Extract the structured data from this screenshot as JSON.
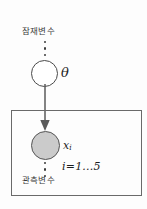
{
  "diagram": {
    "type": "plate-notation-graphical-model",
    "background_color": "#fdfdfd",
    "latent": {
      "label": "잠재변수",
      "node_symbol": "θ",
      "node_fill": "#ffffff",
      "node_stroke": "#4a4a4a",
      "ellipsis": "⋮"
    },
    "observed": {
      "label": "관측변수",
      "node_symbol": "x",
      "node_subscript": "i",
      "node_fill": "#cbcbcb",
      "node_stroke": "#555555",
      "ellipsis": "⋮"
    },
    "plate": {
      "index_label": "i=1...5",
      "border_color": "#6a6a6a"
    },
    "edge": {
      "from": "θ",
      "to": "x",
      "direction": "down",
      "color": "#5a5a5a"
    }
  }
}
